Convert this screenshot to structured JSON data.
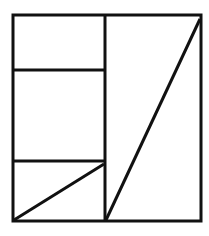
{
  "diagram": {
    "stroke_color": "#111111",
    "background": "#ffffff",
    "outer_square": {
      "x1": 13,
      "y1": 15,
      "x2": 201,
      "y2": 221
    },
    "lines": [
      {
        "name": "center-vertical",
        "x1": 105,
        "y1": 15,
        "x2": 105,
        "y2": 221
      },
      {
        "name": "upper-horizontal",
        "x1": 13,
        "y1": 70,
        "x2": 105,
        "y2": 70
      },
      {
        "name": "lower-horizontal",
        "x1": 13,
        "y1": 161,
        "x2": 105,
        "y2": 161
      },
      {
        "name": "left-diagonal",
        "x1": 13,
        "y1": 221,
        "x2": 104,
        "y2": 164
      },
      {
        "name": "right-diagonal",
        "x1": 105,
        "y1": 221,
        "x2": 201,
        "y2": 19
      }
    ]
  }
}
